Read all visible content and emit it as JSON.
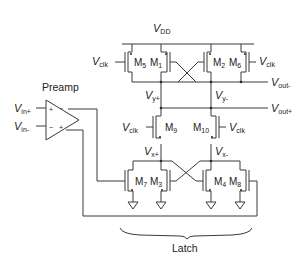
{
  "diagram": {
    "type": "circuit-schematic",
    "supply": {
      "label": "V",
      "sub": "DD"
    },
    "preamp": {
      "label": "Preamp",
      "plus_sign": "+",
      "minus_sign": "−"
    },
    "inputs": [
      {
        "label": "V",
        "sub": "in+"
      },
      {
        "label": "V",
        "sub": "in-"
      }
    ],
    "outputs": [
      {
        "label": "V",
        "sub": "out-"
      },
      {
        "label": "V",
        "sub": "out+"
      }
    ],
    "clock": {
      "label": "V",
      "sub": "clk"
    },
    "nodes": {
      "vy_plus": {
        "label": "V",
        "sub": "y+"
      },
      "vy_minus": {
        "label": "V",
        "sub": "y-"
      },
      "vx_plus": {
        "label": "V",
        "sub": "x+"
      },
      "vx_minus": {
        "label": "V",
        "sub": "x-"
      }
    },
    "transistors": [
      {
        "id": "M5",
        "label": "M",
        "sub": "5",
        "type": "pmos"
      },
      {
        "id": "M1",
        "label": "M",
        "sub": "1",
        "type": "pmos"
      },
      {
        "id": "M2",
        "label": "M",
        "sub": "2",
        "type": "pmos"
      },
      {
        "id": "M6",
        "label": "M",
        "sub": "6",
        "type": "pmos"
      },
      {
        "id": "M9",
        "label": "M",
        "sub": "9",
        "type": "nmos"
      },
      {
        "id": "M10",
        "label": "M",
        "sub": "10",
        "type": "nmos"
      },
      {
        "id": "M7",
        "label": "M",
        "sub": "7",
        "type": "nmos"
      },
      {
        "id": "M3",
        "label": "M",
        "sub": "3",
        "type": "nmos"
      },
      {
        "id": "M4",
        "label": "M",
        "sub": "4",
        "type": "nmos"
      },
      {
        "id": "M8",
        "label": "M",
        "sub": "8",
        "type": "nmos"
      }
    ],
    "latch_label": "Latch"
  }
}
